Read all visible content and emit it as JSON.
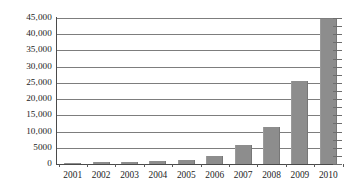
{
  "chart_data": {
    "type": "bar",
    "title": "",
    "subtitle": "",
    "xlabel": "",
    "ylabel": "",
    "categories": [
      "2001",
      "2002",
      "2003",
      "2004",
      "2005",
      "2006",
      "2007",
      "2008",
      "2009",
      "2010"
    ],
    "values": [
      300,
      600,
      550,
      900,
      1300,
      2500,
      5800,
      11500,
      25500,
      44800
    ],
    "ylim": [
      0,
      45000
    ],
    "ytick_values": [
      0,
      5000,
      10000,
      15000,
      20000,
      25000,
      30000,
      35000,
      40000,
      45000
    ],
    "ytick_labels": [
      "0",
      "5000",
      "10,000",
      "15,000",
      "20,000",
      "25,000",
      "30,000",
      "35,000",
      "40,000",
      "45,000"
    ],
    "grid": true,
    "legend": false,
    "legend_position": "none",
    "series": [
      {
        "name": "",
        "values": [
          300,
          600,
          550,
          900,
          1300,
          2500,
          5800,
          11500,
          25500,
          44800
        ]
      }
    ]
  },
  "style": {
    "bar_color": "#8d8d8d",
    "gridline_color": "#7d7d7d",
    "axis_color": "#4a4a4a",
    "text_color": "#1d1d1d",
    "background": "#ffffff"
  }
}
